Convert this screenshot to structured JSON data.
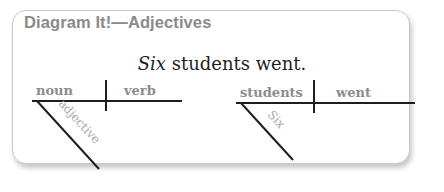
{
  "card": {
    "title": "Diagram It!—Adjectives",
    "sentence": {
      "adjective": "Six",
      "rest": " students went."
    }
  },
  "template_diagram": {
    "subject_label": "noun",
    "verb_label": "verb",
    "modifier_label": "adjective"
  },
  "example_diagram": {
    "subject_label": "students",
    "verb_label": "went",
    "modifier_label": "Six"
  },
  "colors": {
    "title": "#8a8a8a",
    "labels": "#8c8c8c",
    "modifier": "#a8a8a8",
    "lines": "#1e1e1e",
    "sentence": "#1e1e1e"
  }
}
